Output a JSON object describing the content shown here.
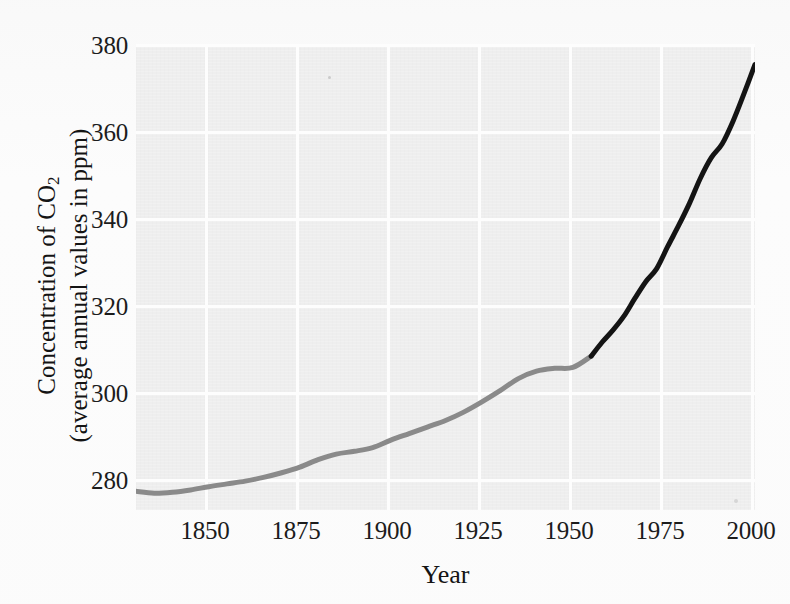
{
  "figure": {
    "kind": "scanned-line-chart",
    "background_color": "#fcfcfc",
    "plot_background_color": "#eeeeee",
    "gridline_color": "#fdfdfd"
  },
  "axes": {
    "y_title_line1": "Concentration of CO",
    "y_title_sub": "2",
    "y_title_line2": "(average annual values in ppm)",
    "x_title": "Year",
    "y_ticks": [
      "380",
      "360",
      "340",
      "320",
      "300",
      "280"
    ],
    "x_ticks": [
      "1850",
      "1875",
      "1900",
      "1925",
      "1950",
      "1975",
      "2000"
    ]
  },
  "chart_data": {
    "type": "line",
    "title": "",
    "subtitle": "",
    "xlabel": "Year",
    "ylabel": "Concentration of CO2 (average annual values in ppm)",
    "xlim": [
      1833,
      2003
    ],
    "ylim": [
      280,
      380
    ],
    "xticks": [
      1850,
      1875,
      1900,
      1925,
      1950,
      1975,
      2000
    ],
    "yticks": [
      280,
      300,
      320,
      340,
      360,
      380
    ],
    "grid": true,
    "legend": "none",
    "series": [
      {
        "name": "Ice core record",
        "color": "#8a8a8a",
        "x": [
          1833,
          1838,
          1843,
          1848,
          1853,
          1858,
          1863,
          1868,
          1873,
          1878,
          1883,
          1888,
          1893,
          1898,
          1903,
          1908,
          1913,
          1918,
          1923,
          1928,
          1933,
          1938,
          1943,
          1948,
          1953,
          1958
        ],
        "y": [
          284.0,
          283.6,
          283.8,
          284.3,
          285.0,
          285.6,
          286.2,
          287.0,
          288.0,
          289.2,
          290.8,
          292.0,
          292.6,
          293.4,
          295.0,
          296.4,
          297.8,
          299.2,
          301.0,
          303.2,
          305.6,
          308.2,
          309.8,
          310.4,
          310.6,
          313.0
        ]
      },
      {
        "name": "Mauna Loa direct measurements",
        "color": "#141414",
        "x": [
          1958,
          1961,
          1964,
          1967,
          1970,
          1973,
          1976,
          1979,
          1982,
          1985,
          1988,
          1991,
          1994,
          1997,
          2000,
          2003
        ],
        "y": [
          313.0,
          316.0,
          318.6,
          321.6,
          325.4,
          329.0,
          331.8,
          336.5,
          341.0,
          345.8,
          351.2,
          355.6,
          358.6,
          363.5,
          369.4,
          375.6
        ]
      }
    ]
  }
}
